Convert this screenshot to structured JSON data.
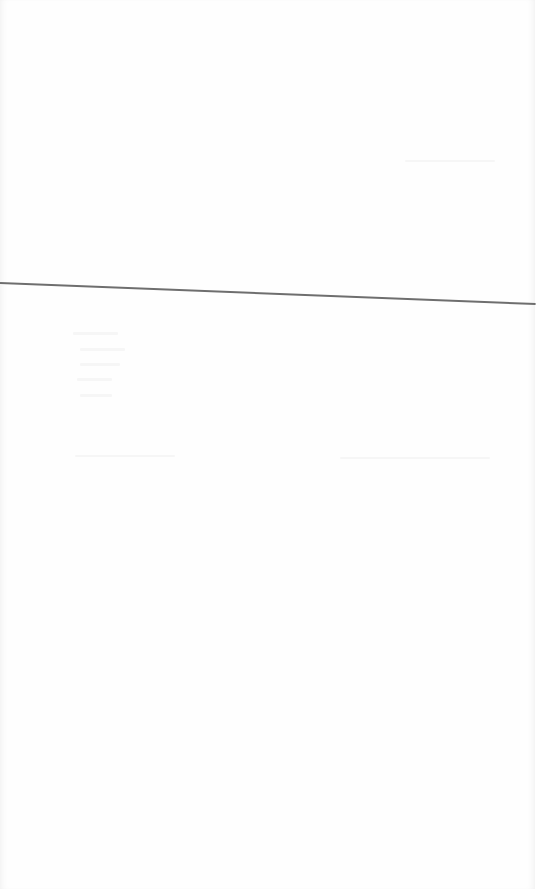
{
  "page": {
    "background": "#fefefe",
    "rule_color": "#6e6e6e"
  },
  "faint_text_lines": [
    {
      "text": "",
      "note": "illegible"
    },
    {
      "text": "",
      "note": "illegible"
    },
    {
      "text": "",
      "note": "illegible"
    },
    {
      "text": "",
      "note": "illegible"
    },
    {
      "text": "",
      "note": "illegible"
    }
  ]
}
